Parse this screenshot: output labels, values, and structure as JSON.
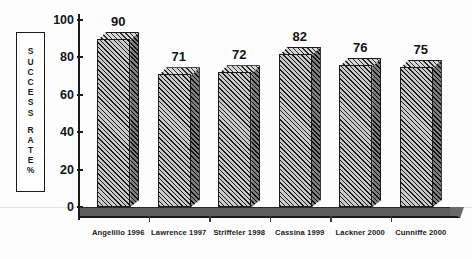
{
  "chart_data": {
    "type": "bar",
    "title": "",
    "subtitle": "",
    "xlabel": "",
    "ylabel": "SUCCESS RATE %",
    "ylim": [
      0,
      100
    ],
    "yticks": [
      0,
      20,
      40,
      60,
      80,
      100
    ],
    "grid": false,
    "legend": "none",
    "style": "3d-hatched-grayscale",
    "categories": [
      "Angelillo 1996",
      "Lawrence 1997",
      "Striffeler 1998",
      "Cassina 1999",
      "Lackner 2000",
      "Cunniffe 2000"
    ],
    "values": [
      90,
      71,
      72,
      82,
      76,
      75
    ],
    "value_labels": [
      "90",
      "71",
      "72",
      "82",
      "76",
      "75"
    ]
  },
  "axis": {
    "y_label_box": {
      "text": "SUCCESS RATE %",
      "chars": [
        "S",
        "U",
        "C",
        "C",
        "E",
        "S",
        "S",
        "",
        "R",
        "A",
        "T",
        "E",
        "%"
      ]
    },
    "y_tick_labels": [
      "100",
      "80",
      "60",
      "40",
      "20",
      "0"
    ]
  },
  "colors": {
    "background": "#fdfdfd",
    "bar_front": "#c9c9c9",
    "bar_side": "#7e7e7e",
    "bar_top": "#d6d6d6",
    "outline": "#1a1a1a",
    "floor": "#5d5d5d",
    "text": "#141414"
  }
}
